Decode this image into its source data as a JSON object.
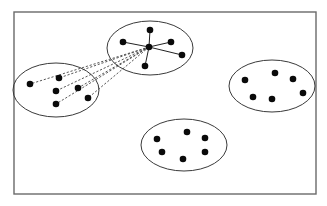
{
  "diagram": {
    "type": "cluster-graph",
    "width": 327,
    "height": 206,
    "colors": {
      "background": "#ffffff",
      "frame": "#6a6a6a",
      "ellipse": "#3a3a3a",
      "node": "#0a0a0a",
      "edge": "#222222"
    },
    "frame": {
      "x": 14,
      "y": 12,
      "w": 302,
      "h": 182
    },
    "clusters": [
      {
        "id": "top",
        "ellipse": {
          "cx": 150,
          "cy": 48,
          "rx": 43,
          "ry": 27
        },
        "hub": {
          "x": 149,
          "y": 47
        },
        "nodes": [
          {
            "x": 150,
            "y": 30
          },
          {
            "x": 123,
            "y": 42
          },
          {
            "x": 171,
            "y": 42
          },
          {
            "x": 182,
            "y": 55
          },
          {
            "x": 145,
            "y": 66
          }
        ],
        "edge_style": "solid-star"
      },
      {
        "id": "left",
        "ellipse": {
          "cx": 56,
          "cy": 90,
          "rx": 43,
          "ry": 27
        },
        "nodes": [
          {
            "x": 30,
            "y": 84
          },
          {
            "x": 59,
            "y": 78
          },
          {
            "x": 56,
            "y": 91
          },
          {
            "x": 78,
            "y": 88
          },
          {
            "x": 88,
            "y": 98
          },
          {
            "x": 56,
            "y": 104
          }
        ],
        "edge_style": "dashed-to-top-hub"
      },
      {
        "id": "right",
        "ellipse": {
          "cx": 272,
          "cy": 86,
          "rx": 43,
          "ry": 26
        },
        "nodes": [
          {
            "x": 245,
            "y": 80
          },
          {
            "x": 275,
            "y": 73
          },
          {
            "x": 293,
            "y": 79
          },
          {
            "x": 303,
            "y": 93
          },
          {
            "x": 253,
            "y": 97
          },
          {
            "x": 272,
            "y": 99
          }
        ],
        "edge_style": "none"
      },
      {
        "id": "bottom",
        "ellipse": {
          "cx": 184,
          "cy": 145,
          "rx": 43,
          "ry": 26
        },
        "nodes": [
          {
            "x": 157,
            "y": 139
          },
          {
            "x": 187,
            "y": 132
          },
          {
            "x": 205,
            "y": 138
          },
          {
            "x": 162,
            "y": 152
          },
          {
            "x": 183,
            "y": 159
          },
          {
            "x": 205,
            "y": 152
          }
        ],
        "edge_style": "none"
      }
    ],
    "node_radius": 3.3
  }
}
